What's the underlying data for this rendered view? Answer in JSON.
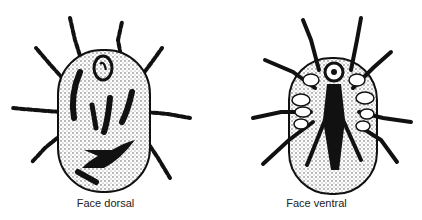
{
  "figures": [
    {
      "id": "dorsal",
      "caption": "Face dorsal",
      "subject": "mite-dorsal-view"
    },
    {
      "id": "ventral",
      "caption": "Face ventral",
      "subject": "mite-ventral-view"
    }
  ],
  "colors": {
    "ink": "#111111",
    "stipple": "#555555",
    "background": "#ffffff"
  }
}
